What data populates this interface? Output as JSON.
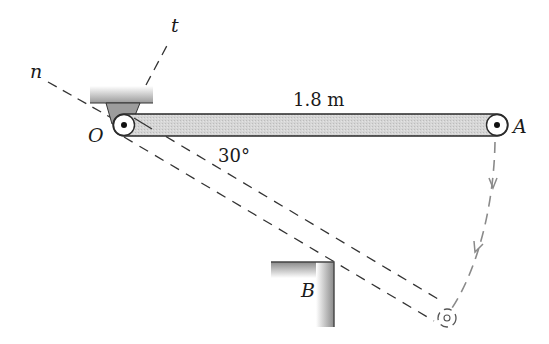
{
  "diagram": {
    "type": "mechanics-pendulum-bar",
    "labels": {
      "normal_axis": "n",
      "tangent_axis": "t",
      "pivot": "O",
      "end": "A",
      "block": "B",
      "length": "1.8 m",
      "angle": "30°"
    },
    "colors": {
      "bar_fill": "#d4d4d4",
      "outline": "#2a2a2a",
      "dashed": "#555555",
      "path": "#8a8a8a",
      "support": "#a8a8a8"
    }
  }
}
